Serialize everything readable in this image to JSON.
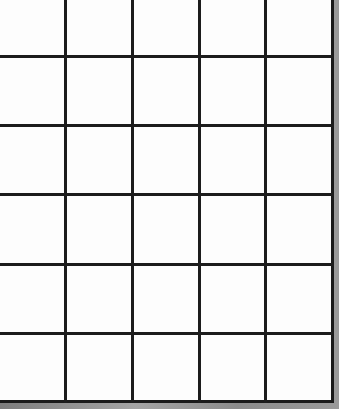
{
  "grid": {
    "columns": 5,
    "rows": 6,
    "line_color": "#1c1c1c",
    "paper_color": "#fdfdfd",
    "vertical_lines_x": [
      64,
      131,
      198,
      264
    ],
    "horizontal_lines_y": [
      55,
      124,
      193,
      263,
      332
    ],
    "cells": [
      [
        "",
        "",
        "",
        "",
        ""
      ],
      [
        "",
        "",
        "",
        "",
        ""
      ],
      [
        "",
        "",
        "",
        "",
        ""
      ],
      [
        "",
        "",
        "",
        "",
        ""
      ],
      [
        "",
        "",
        "",
        "",
        ""
      ],
      [
        "",
        "",
        "",
        "",
        ""
      ]
    ]
  }
}
